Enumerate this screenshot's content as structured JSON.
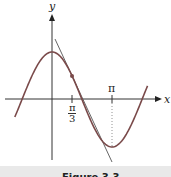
{
  "chart_data": {
    "type": "line",
    "title": "",
    "xlabel": "x",
    "ylabel": "y",
    "series": [
      {
        "name": "curve",
        "function": "cos(x)",
        "x_range": [
          "-π/2",
          "3π/2"
        ]
      },
      {
        "name": "tangent line at x = π/3",
        "point": [
          "π/3",
          "1/2"
        ],
        "slope": "-√3/2"
      }
    ],
    "x_ticks": [
      {
        "value": "π/3",
        "label_num": "π",
        "label_den": "3"
      },
      {
        "value": "π",
        "label": "π"
      }
    ],
    "annotations": [
      {
        "type": "point",
        "at": "x = π/3"
      },
      {
        "type": "dotted-vertical",
        "at": "x = π",
        "to": "minimum"
      }
    ],
    "grid": false,
    "legend": null
  },
  "labels": {
    "x_axis": "x",
    "y_axis": "y",
    "tick_pi": "π",
    "tick_pi_third_num": "π",
    "tick_pi_third_den": "3"
  },
  "caption": "Figure 3.3"
}
